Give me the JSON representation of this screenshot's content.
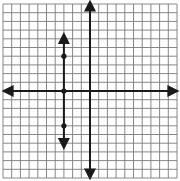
{
  "chart_data": {
    "type": "line",
    "title": "",
    "xlabel": "",
    "ylabel": "",
    "xlim": [
      -10,
      10
    ],
    "ylim": [
      -10,
      10
    ],
    "grid": true,
    "grid_step": 1,
    "axes_arrows": true,
    "series": [
      {
        "name": "vertical line x = -3",
        "kind": "line",
        "x": [
          -3,
          -3
        ],
        "y": [
          6.5,
          -6.5
        ],
        "arrows": "both",
        "points": [
          {
            "x": -3,
            "y": 4
          },
          {
            "x": -3,
            "y": 0
          },
          {
            "x": -3,
            "y": -4
          }
        ]
      }
    ]
  },
  "colors": {
    "background": "#ffffff",
    "grid": "#7a7a7a",
    "axis": "#1a1a1a",
    "line": "#1a1a1a"
  },
  "layout": {
    "origin_px": [
      90,
      91
    ],
    "unit_px": 8.7,
    "grid_left": 3,
    "grid_top": 4,
    "grid_right": 177,
    "grid_bottom": 178
  }
}
